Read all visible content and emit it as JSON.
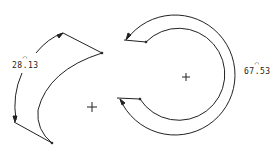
{
  "drawing": {
    "background": "#ffffff",
    "stroke_color": "#222222",
    "left_figure": {
      "name": "crescent-arc-segment",
      "center_mark": {
        "x": 92,
        "y": 107
      },
      "dimension": {
        "value": "28.13",
        "arc_symbol": "⌒",
        "label_x": 14,
        "label_y": 63
      }
    },
    "right_figure": {
      "name": "c-shaped-ring",
      "center_mark": {
        "x": 186,
        "y": 77
      },
      "dimension": {
        "value": "67.53",
        "arc_symbol": "⌒",
        "label_x": 247,
        "label_y": 66
      }
    }
  }
}
